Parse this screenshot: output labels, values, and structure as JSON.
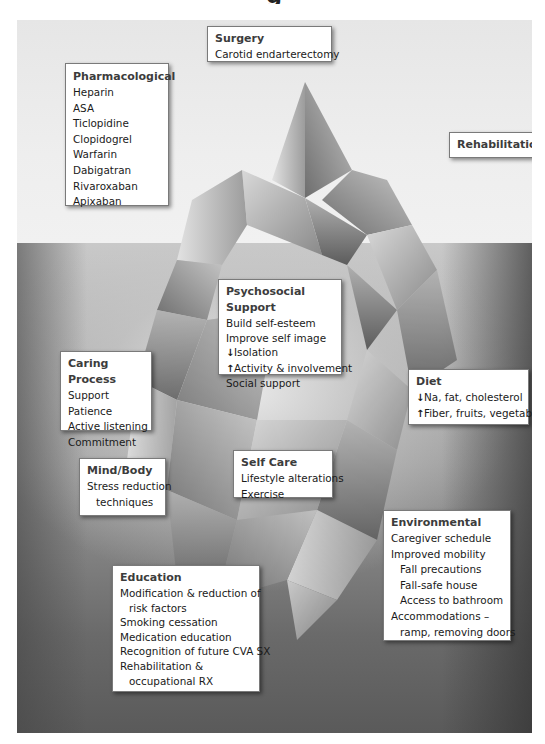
{
  "diagram": {
    "type": "iceberg",
    "title_fragment": "g",
    "above_water_label": "Visible treatments",
    "colors": {
      "sky": "#ececec",
      "water_top": "#c9c9c9",
      "water_bottom": "#5a5a5a",
      "box_bg": "#ffffff",
      "box_border": "#7a7a7a",
      "heading": "#3c3c3c"
    }
  },
  "boxes": {
    "surgery": {
      "heading": "Surgery",
      "items": [
        "Carotid endarterectomy"
      ]
    },
    "pharmacological": {
      "heading": "Pharmacological",
      "items": [
        "Heparin",
        "ASA",
        "Ticlopidine",
        "Clopidogrel",
        "Warfarin",
        "Dabigatran",
        "Rivaroxaban",
        "Apixaban"
      ]
    },
    "rehabilitation": {
      "heading": "Rehabilitation"
    },
    "psychosocial": {
      "heading": "Psychosocial Support",
      "items": [
        "Build self-esteem",
        "Improve self image",
        "Isolation",
        "Activity & involvement",
        "Social support"
      ],
      "arrows": {
        "down": "↓",
        "up": "↑"
      }
    },
    "caring": {
      "heading": "Caring Process",
      "items": [
        "Support",
        "Patience",
        "Active listening",
        "Commitment"
      ]
    },
    "diet": {
      "heading": "Diet",
      "items": [
        "Na, fat, cholesterol",
        "Fiber, fruits, vegetables"
      ],
      "arrows": {
        "down": "↓",
        "up": "↑"
      }
    },
    "mindbody": {
      "heading": "Mind/Body",
      "items": [
        "Stress reduction",
        "techniques"
      ]
    },
    "selfcare": {
      "heading": "Self Care",
      "items": [
        "Lifestyle alterations",
        "Exercise"
      ]
    },
    "environmental": {
      "heading": "Environmental",
      "items": [
        "Caregiver schedule",
        "Improved mobility",
        "Fall precautions",
        "Fall-safe house",
        "Access to bathroom",
        "Accommodations –",
        "ramp, removing doors"
      ]
    },
    "education": {
      "heading": "Education",
      "items": [
        "Modification & reduction of",
        "risk factors",
        "Smoking cessation",
        "Medication education",
        "Recognition of future CVA SX",
        "Rehabilitation &",
        "occupational RX"
      ]
    }
  }
}
